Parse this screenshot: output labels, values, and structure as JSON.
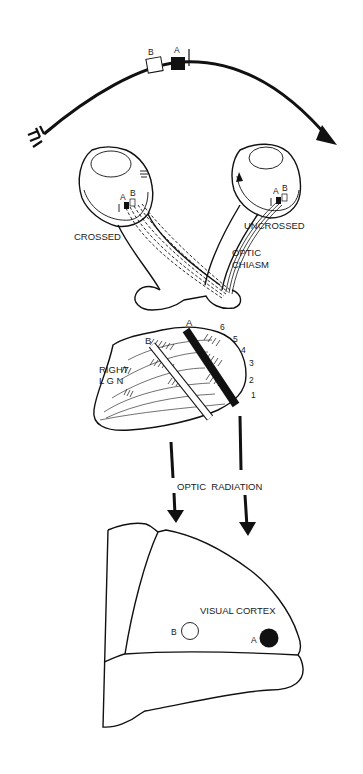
{
  "diagram": {
    "colors": {
      "ink": "#111111",
      "background": "#ffffff"
    },
    "visual_field": {
      "points": [
        {
          "label": "B",
          "fill": "open"
        },
        {
          "label": "A",
          "fill": "filled"
        }
      ]
    },
    "eyes": {
      "left": {
        "retina_labels": [
          "A",
          "B"
        ],
        "fiber_label": "CROSSED"
      },
      "right": {
        "retina_labels": [
          "A",
          "B"
        ],
        "fiber_label": "UNCROSSED"
      }
    },
    "chiasm": {
      "label_line1": "OPTIC",
      "label_line2": "CHIASM"
    },
    "lgn": {
      "label_line1": "RIGHT",
      "label_line2": "L G N",
      "point_labels": [
        "A",
        "B"
      ],
      "layers": [
        "6",
        "5",
        "4",
        "3",
        "2",
        "1"
      ]
    },
    "radiation": {
      "label": "OPTIC  RADIATION"
    },
    "cortex": {
      "label": "VISUAL CORTEX",
      "points": [
        {
          "label": "B",
          "fill": "open"
        },
        {
          "label": "A",
          "fill": "filled"
        }
      ]
    }
  }
}
